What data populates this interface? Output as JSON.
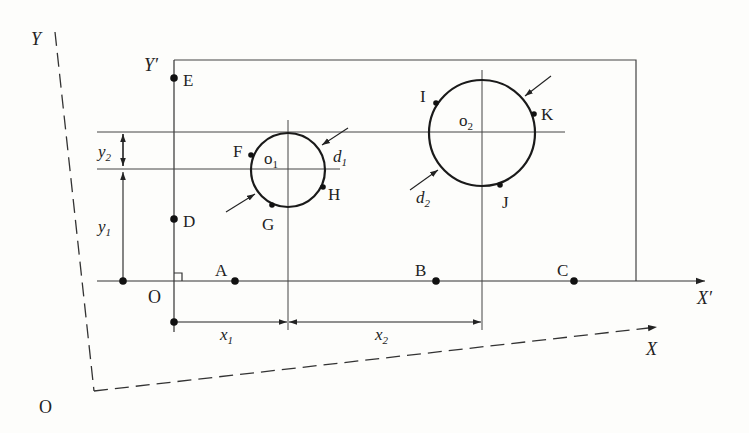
{
  "diagram": {
    "type": "coordinate-measurement-schematic",
    "colors": {
      "line": "#333333",
      "background": "#fdfdfb"
    },
    "machine_axes": {
      "x_label": "X",
      "y_label": "Y",
      "origin_label": "O"
    },
    "part_axes": {
      "x_label": "X",
      "x_prime": "′",
      "y_label": "Y",
      "y_prime": "′",
      "origin_label": "O"
    },
    "points": {
      "A": "A",
      "B": "B",
      "C": "C",
      "D": "D",
      "E": "E",
      "F": "F",
      "G": "G",
      "H": "H",
      "I": "I",
      "J": "J",
      "K": "K"
    },
    "circles": [
      {
        "center_label": "o",
        "center_sub": "1",
        "diameter_label": "d",
        "diameter_sub": "1"
      },
      {
        "center_label": "o",
        "center_sub": "2",
        "diameter_label": "d",
        "diameter_sub": "2"
      }
    ],
    "dimensions": {
      "x1": {
        "label": "x",
        "sub": "1"
      },
      "x2": {
        "label": "x",
        "sub": "2"
      },
      "y1": {
        "label": "y",
        "sub": "1"
      },
      "y2": {
        "label": "y",
        "sub": "2"
      }
    }
  }
}
